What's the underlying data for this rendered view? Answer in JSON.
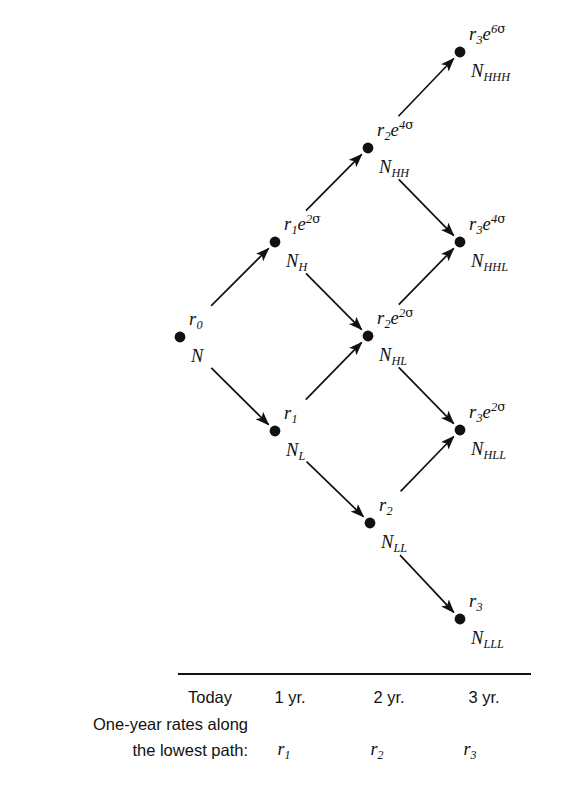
{
  "figure": {
    "background_color": "#ffffff",
    "ink_color": "#111111"
  },
  "tree": {
    "nodes": [
      {
        "id": "root",
        "name": "N",
        "name_sub": "",
        "rate": "r",
        "rate_sub": "0",
        "exp": "",
        "x": 180,
        "y": 337
      },
      {
        "id": "H",
        "name": "N",
        "name_sub": "H",
        "rate": "r",
        "rate_sub": "1",
        "exp": "2",
        "x": 275,
        "y": 242
      },
      {
        "id": "L",
        "name": "N",
        "name_sub": "L",
        "rate": "r",
        "rate_sub": "1",
        "exp": "",
        "x": 275,
        "y": 431
      },
      {
        "id": "HH",
        "name": "N",
        "name_sub": "HH",
        "rate": "r",
        "rate_sub": "2",
        "exp": "4",
        "x": 368,
        "y": 148
      },
      {
        "id": "HL",
        "name": "N",
        "name_sub": "HL",
        "rate": "r",
        "rate_sub": "2",
        "exp": "2",
        "x": 368,
        "y": 336
      },
      {
        "id": "LL",
        "name": "N",
        "name_sub": "LL",
        "rate": "r",
        "rate_sub": "2",
        "exp": "",
        "x": 370,
        "y": 523
      },
      {
        "id": "HHH",
        "name": "N",
        "name_sub": "HHH",
        "rate": "r",
        "rate_sub": "3",
        "exp": "6",
        "x": 460,
        "y": 52
      },
      {
        "id": "HHL",
        "name": "N",
        "name_sub": "HHL",
        "rate": "r",
        "rate_sub": "3",
        "exp": "4",
        "x": 460,
        "y": 242
      },
      {
        "id": "HLL",
        "name": "N",
        "name_sub": "HLL",
        "rate": "r",
        "rate_sub": "3",
        "exp": "2",
        "x": 460,
        "y": 430
      },
      {
        "id": "LLL",
        "name": "N",
        "name_sub": "LLL",
        "rate": "r",
        "rate_sub": "3",
        "exp": "",
        "x": 460,
        "y": 619
      }
    ],
    "edges": [
      {
        "from": "root",
        "to": "H",
        "direction": "up"
      },
      {
        "from": "root",
        "to": "L",
        "direction": "down"
      },
      {
        "from": "H",
        "to": "HH",
        "direction": "up"
      },
      {
        "from": "H",
        "to": "HL",
        "direction": "down"
      },
      {
        "from": "L",
        "to": "HL",
        "direction": "up"
      },
      {
        "from": "L",
        "to": "LL",
        "direction": "down"
      },
      {
        "from": "HH",
        "to": "HHH",
        "direction": "up"
      },
      {
        "from": "HH",
        "to": "HHL",
        "direction": "down"
      },
      {
        "from": "HL",
        "to": "HHL",
        "direction": "up"
      },
      {
        "from": "HL",
        "to": "HLL",
        "direction": "down"
      },
      {
        "from": "LL",
        "to": "HLL",
        "direction": "up"
      },
      {
        "from": "LL",
        "to": "LLL",
        "direction": "down"
      }
    ],
    "sigma_symbol": "σ",
    "exp_base": "e"
  },
  "legend": {
    "columns": [
      {
        "label": "Today",
        "x": 210
      },
      {
        "label": "1 yr.",
        "x": 290
      },
      {
        "label": "2 yr.",
        "x": 389
      },
      {
        "label": "3 yr.",
        "x": 484
      }
    ],
    "caption_line1": "One-year rates along",
    "caption_line2": "the lowest path:",
    "rates": [
      {
        "symbol": "r",
        "sub": "1",
        "x": 284
      },
      {
        "symbol": "r",
        "sub": "2",
        "x": 377
      },
      {
        "symbol": "r",
        "sub": "3",
        "x": 470
      }
    ],
    "rule": {
      "x": 178,
      "y": 673,
      "width": 353,
      "height": 2
    }
  }
}
